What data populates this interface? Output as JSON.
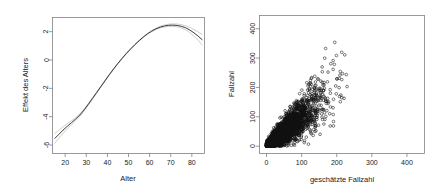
{
  "figure": {
    "background": "#ffffff",
    "panel_count": 2
  },
  "chart_data": [
    {
      "type": "line",
      "title": "",
      "xlabel": "Alter",
      "ylabel": "Effekt des Alters",
      "xlim": [
        14,
        86
      ],
      "ylim": [
        -6.6,
        3.0
      ],
      "xticks": [
        20,
        30,
        40,
        50,
        60,
        70,
        80
      ],
      "xticklabels": [
        "20",
        "30",
        "40",
        "50",
        "60",
        "70",
        "80"
      ],
      "yticks": [
        2,
        0,
        -2,
        -4,
        -6
      ],
      "yticklabels": [
        "2",
        "0",
        "-2",
        "-4",
        "-6"
      ],
      "grid": false,
      "legend": null,
      "series": [
        {
          "name": "Effekt des Alters (Glättung)",
          "style": "smooth-spline",
          "color": "#3a3a3a",
          "x": [
            15,
            17,
            19,
            21,
            23,
            25,
            27,
            29,
            31,
            33,
            35,
            37,
            39,
            41,
            43,
            45,
            47,
            49,
            51,
            53,
            55,
            57,
            59,
            61,
            63,
            65,
            67,
            69,
            71,
            73,
            75,
            77,
            79,
            81,
            83,
            85
          ],
          "y": [
            -5.55,
            -5.25,
            -4.95,
            -4.68,
            -4.42,
            -4.16,
            -3.88,
            -3.52,
            -3.12,
            -2.7,
            -2.28,
            -1.86,
            -1.44,
            -1.02,
            -0.62,
            -0.24,
            0.12,
            0.46,
            0.78,
            1.08,
            1.36,
            1.62,
            1.85,
            2.04,
            2.2,
            2.32,
            2.4,
            2.45,
            2.46,
            2.44,
            2.38,
            2.28,
            2.12,
            1.92,
            1.68,
            1.42
          ]
        },
        {
          "name": "Konfidenzband oben",
          "style": "confidence-upper",
          "color": "#b8b8b8",
          "x": [
            15,
            17,
            19,
            21,
            23,
            25,
            27,
            29,
            31,
            33,
            35,
            37,
            39,
            41,
            43,
            45,
            47,
            49,
            51,
            53,
            55,
            57,
            59,
            61,
            63,
            65,
            67,
            69,
            71,
            73,
            75,
            77,
            79,
            81,
            83,
            85
          ],
          "y": [
            -5.2,
            -4.97,
            -4.72,
            -4.5,
            -4.28,
            -4.05,
            -3.79,
            -3.45,
            -3.06,
            -2.65,
            -2.24,
            -1.82,
            -1.4,
            -0.99,
            -0.59,
            -0.21,
            0.15,
            0.49,
            0.81,
            1.11,
            1.39,
            1.65,
            1.88,
            2.08,
            2.25,
            2.38,
            2.47,
            2.53,
            2.55,
            2.54,
            2.5,
            2.42,
            2.3,
            2.15,
            1.97,
            1.8
          ]
        },
        {
          "name": "Konfidenzband unten",
          "style": "confidence-lower",
          "color": "#b8b8b8",
          "x": [
            15,
            17,
            19,
            21,
            23,
            25,
            27,
            29,
            31,
            33,
            35,
            37,
            39,
            41,
            43,
            45,
            47,
            49,
            51,
            53,
            55,
            57,
            59,
            61,
            63,
            65,
            67,
            69,
            71,
            73,
            75,
            77,
            79,
            81,
            83,
            85
          ],
          "y": [
            -5.9,
            -5.53,
            -5.18,
            -4.86,
            -4.56,
            -4.27,
            -3.97,
            -3.59,
            -3.18,
            -2.75,
            -2.32,
            -1.9,
            -1.48,
            -1.05,
            -0.65,
            -0.27,
            0.09,
            0.43,
            0.74,
            1.05,
            1.33,
            1.59,
            1.82,
            2.0,
            2.15,
            2.26,
            2.33,
            2.37,
            2.37,
            2.34,
            2.26,
            2.14,
            1.94,
            1.69,
            1.39,
            1.04
          ]
        }
      ]
    },
    {
      "type": "scatter",
      "title": "",
      "xlabel": "geschätzte Fallzahl",
      "ylabel": "Fallzahl",
      "xlim": [
        -20,
        450
      ],
      "ylim": [
        -25,
        445
      ],
      "xticks": [
        0,
        100,
        200,
        300,
        400
      ],
      "xticklabels": [
        "0",
        "100",
        "200",
        "300",
        "400"
      ],
      "yticks": [
        0,
        100,
        200,
        300,
        400
      ],
      "yticklabels": [
        "0",
        "100",
        "200",
        "300",
        "400"
      ],
      "grid": false,
      "legend": null,
      "marker": "open-circle",
      "marker_color": "#111111",
      "description": "Dichte Punktwolke entlang der Diagonalen, Streuung nimmt mit der Höhe zu",
      "point_count_approx": 4200,
      "cluster": {
        "core_x_range": [
          0,
          150
        ],
        "core_y_range": [
          0,
          160
        ],
        "slope": 1.0,
        "spread_growth": "linear"
      }
    }
  ]
}
